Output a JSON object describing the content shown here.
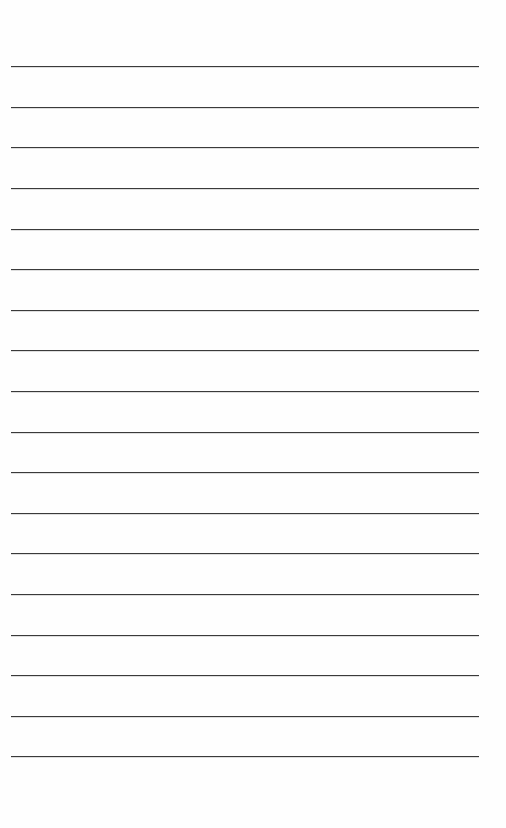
{
  "page": {
    "type": "lined-paper",
    "line_count": 18,
    "line_color": "#3a3a3a",
    "background_color": "#fefefe",
    "line_positions_y": [
      66,
      107,
      147,
      188,
      229,
      269,
      310,
      350,
      391,
      432,
      472,
      513,
      553,
      594,
      635,
      675,
      716,
      756
    ],
    "line_left_x": 11,
    "line_width": 468
  }
}
